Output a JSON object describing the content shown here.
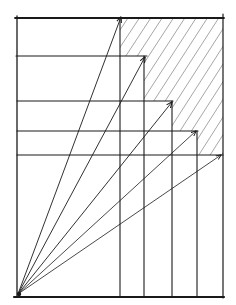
{
  "diagram": {
    "title": "",
    "style": "hand-drawn pen sketch",
    "colors": {
      "ink": "#1a1a1a",
      "hatch": "#555555",
      "background": "#ffffff"
    },
    "origin": {
      "x": 18,
      "y": 294
    },
    "frame": {
      "left": 17,
      "top": 18,
      "right": 223,
      "bottom": 297
    },
    "arrows": [
      {
        "id": "arrow-1",
        "tip": {
          "x": 121,
          "y": 17
        }
      },
      {
        "id": "arrow-2",
        "tip": {
          "x": 145,
          "y": 57
        }
      },
      {
        "id": "arrow-3",
        "tip": {
          "x": 172,
          "y": 102
        }
      },
      {
        "id": "arrow-4",
        "tip": {
          "x": 196,
          "y": 131
        }
      },
      {
        "id": "arrow-5",
        "tip": {
          "x": 221,
          "y": 155
        }
      }
    ],
    "horizontal_lines": [
      {
        "y": 18,
        "x1": 17,
        "x2": 223
      },
      {
        "y": 56,
        "x1": 17,
        "x2": 146
      },
      {
        "y": 101,
        "x1": 17,
        "x2": 172
      },
      {
        "y": 131,
        "x1": 17,
        "x2": 197
      },
      {
        "y": 155,
        "x1": 17,
        "x2": 223
      }
    ],
    "vertical_lines": [
      {
        "x": 120,
        "y1": 18,
        "y2": 297
      },
      {
        "x": 144,
        "y1": 56,
        "y2": 297
      },
      {
        "x": 172,
        "y1": 101,
        "y2": 297
      },
      {
        "x": 197,
        "y1": 131,
        "y2": 297
      }
    ],
    "hatched_region": "staircase area above-right of arrow tips, bounded by top and right frame edges"
  }
}
